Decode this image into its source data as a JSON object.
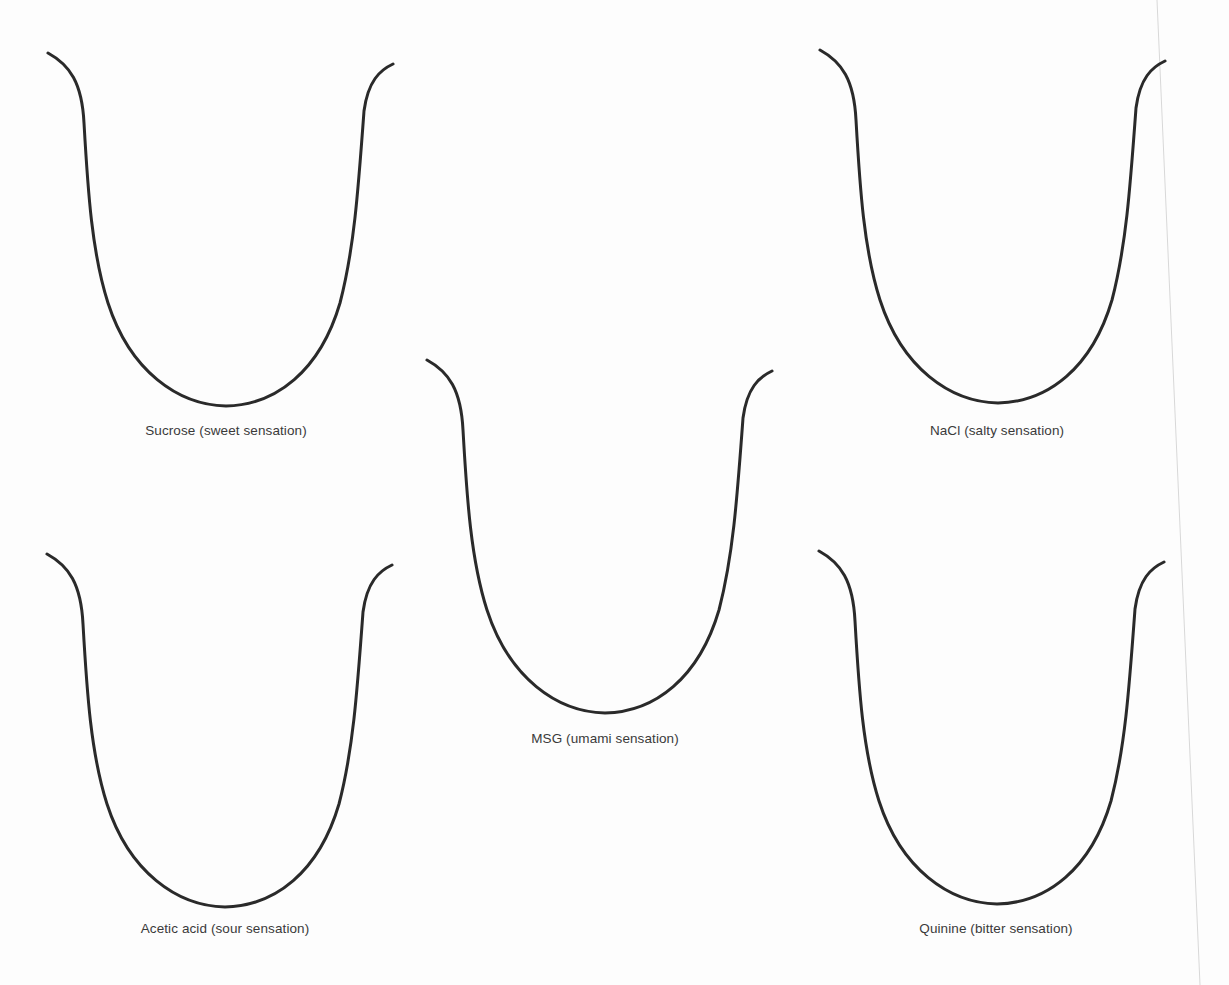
{
  "diagram": {
    "type": "tongue-outline-worksheet",
    "stroke_color": "#2a2a2a",
    "label_color": "#3a3a3a",
    "background": "#fdfdfd",
    "tongues": [
      {
        "id": "sucrose",
        "label": "Sucrose (sweet sensation)",
        "x": 48,
        "y": 53,
        "label_x": 226,
        "label_y": 423
      },
      {
        "id": "nacl",
        "label": "NaCl (salty sensation)",
        "x": 820,
        "y": 50,
        "label_x": 997,
        "label_y": 423
      },
      {
        "id": "msg",
        "label": "MSG (umami sensation)",
        "x": 427,
        "y": 360,
        "label_x": 605,
        "label_y": 731
      },
      {
        "id": "acetic-acid",
        "label": "Acetic acid (sour sensation)",
        "x": 47,
        "y": 554,
        "label_x": 225,
        "label_y": 921
      },
      {
        "id": "quinine",
        "label": "Quinine (bitter sensation)",
        "x": 819,
        "y": 551,
        "label_x": 996,
        "label_y": 921
      }
    ]
  }
}
